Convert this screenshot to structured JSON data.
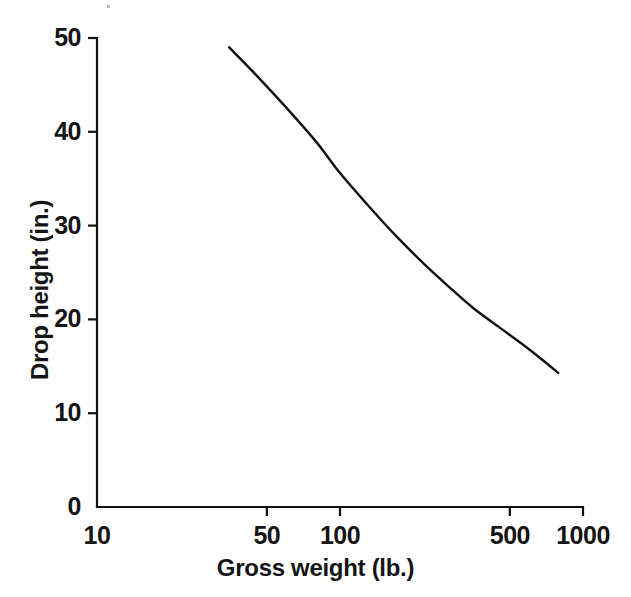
{
  "chart_data": {
    "type": "line",
    "title": "",
    "subtitle": "",
    "xlabel": "Gross weight (lb.)",
    "ylabel": "Drop height (in.)",
    "xscale": "log",
    "yscale": "linear",
    "xlim": [
      10,
      1000
    ],
    "ylim": [
      0,
      50
    ],
    "grid": false,
    "legend": false,
    "legend_position": "none",
    "xticks": [
      10,
      50,
      100,
      500,
      1000
    ],
    "xtick_labels": [
      "10",
      "50",
      "100",
      "500",
      "1000"
    ],
    "yticks": [
      0,
      10,
      20,
      30,
      40,
      50
    ],
    "ytick_labels": [
      "0",
      "10",
      "20",
      "30",
      "40",
      "50"
    ],
    "line_color": "#111111",
    "series": [
      {
        "name": "Drop height",
        "x": [
          35,
          45,
          60,
          80,
          100,
          130,
          170,
          220,
          280,
          350,
          450,
          560,
          680,
          790
        ],
        "y": [
          49.0,
          46.1,
          42.6,
          38.9,
          35.6,
          32.2,
          28.9,
          26.0,
          23.5,
          21.3,
          19.2,
          17.4,
          15.7,
          14.3
        ]
      }
    ],
    "annotations": []
  },
  "axis_titles": {
    "x": "Gross weight (lb.)",
    "y": "Drop height (in.)"
  }
}
